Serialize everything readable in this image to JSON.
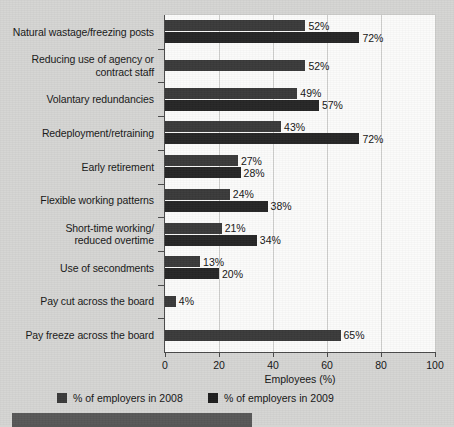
{
  "chart_data": {
    "type": "bar",
    "orientation": "horizontal",
    "title": "",
    "xlabel": "Employees (%)",
    "ylabel": "",
    "xlim": [
      0,
      100
    ],
    "xticks": [
      0,
      20,
      40,
      60,
      80,
      100
    ],
    "grid": "vertical gridlines at 20, 40, 60, 80",
    "legend_position": "below-plot",
    "categories": [
      "Natural wastage/freezing posts",
      "Reducing use of agency or\ncontract staff",
      "Volantary redundancies",
      "Redeployment/retraining",
      "Early retirement",
      "Flexible working patterns",
      "Short-time working/\nreduced overtime",
      "Use of secondments",
      "Pay cut across the board",
      "Pay freeze across the board"
    ],
    "series": [
      {
        "name": "% of employers in 2008",
        "color": "#3a3a3a",
        "values": [
          52,
          52,
          49,
          43,
          27,
          24,
          21,
          13,
          4,
          65
        ],
        "labels": [
          "52%",
          "52%",
          "49%",
          "43%",
          "27%",
          "24%",
          "21%",
          "13%",
          "4%",
          "65%"
        ]
      },
      {
        "name": "% of employers in 2009",
        "color": "#262626",
        "values": [
          72,
          null,
          57,
          72,
          28,
          38,
          34,
          20,
          null,
          null
        ],
        "labels": [
          "72%",
          "",
          "57%",
          "72%",
          "28%",
          "38%",
          "34%",
          "20%",
          "",
          ""
        ]
      }
    ]
  },
  "legend": {
    "entries": [
      {
        "label": "% of employers in 2008",
        "color": "#3a3a3a"
      },
      {
        "label": "% of employers in 2009",
        "color": "#1e1e1e"
      }
    ]
  },
  "axis": {
    "x_title": "Employees (%)",
    "tick_labels": [
      "0",
      "20",
      "40",
      "60",
      "80",
      "100"
    ]
  },
  "colors": {
    "background": "#d5d5d3",
    "plot_background": "#fbfbfa",
    "gridline": "#cfcfcd",
    "axis": "#4a4a4a",
    "series_2008": "#3a3a3a",
    "series_2009": "#262626",
    "bottom_band": "#575757"
  }
}
